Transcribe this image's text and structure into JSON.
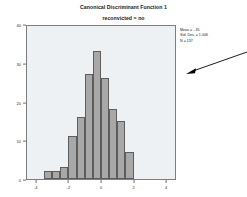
{
  "chart_data": {
    "type": "bar",
    "title": "Canonical Discriminant Function 1",
    "subtitle": "reconvicted = no",
    "xlabel": "",
    "ylabel": "",
    "xlim": [
      -4.6,
      4.6
    ],
    "ylim": [
      0,
      40
    ],
    "grid": false,
    "legend": null,
    "bin_width": 0.5,
    "categories": [
      "-3.25",
      "-2.75",
      "-2.25",
      "-1.75",
      "-1.25",
      "-0.75",
      "-0.25",
      "0.25",
      "0.75",
      "1.25",
      "1.75"
    ],
    "x": [
      -3.25,
      -2.75,
      -2.25,
      -1.75,
      -1.25,
      -0.75,
      -0.25,
      0.25,
      0.75,
      1.25,
      1.75
    ],
    "values": [
      2,
      2,
      3,
      11,
      16,
      27,
      33,
      26,
      18,
      15,
      7
    ],
    "ytick_labels": [
      "0",
      "10",
      "20",
      "30",
      "40"
    ],
    "ytick_values": [
      0,
      10,
      20,
      30,
      40
    ],
    "xtick_labels": [
      "-4",
      "-2",
      "0",
      "2",
      "4"
    ],
    "xtick_values": [
      -4,
      -2,
      0,
      2,
      4
    ],
    "annotations": {
      "mean_label": "Mean = -.35",
      "std_dev_label": "Std. Dev. = 1.006",
      "n_label": "N = 137"
    },
    "colors": {
      "bar_fill": "#a8a8a8",
      "bar_border": "#5d5d5d",
      "plot_background": "#eef1f3",
      "frame": "#7d7d7d",
      "text": "#1a1a1a",
      "arrow": "#000000"
    }
  }
}
